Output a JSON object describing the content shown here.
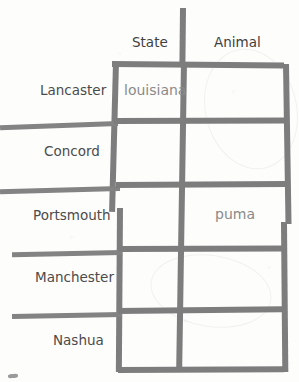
{
  "table": {
    "columns": [
      "State",
      "Animal"
    ],
    "rows": [
      "Lancaster",
      "Concord",
      "Portsmouth",
      "Manchester",
      "Nashua"
    ],
    "cells": [
      [
        "louisiana",
        ""
      ],
      [
        "",
        ""
      ],
      [
        "",
        "puma"
      ],
      [
        "",
        ""
      ],
      [
        "",
        ""
      ]
    ]
  },
  "style": {
    "ink_color": "#7d7d7d",
    "label_color": "#4b4b4b",
    "value_color": "#8a8a8a",
    "background_color": "#fdfdfc"
  }
}
